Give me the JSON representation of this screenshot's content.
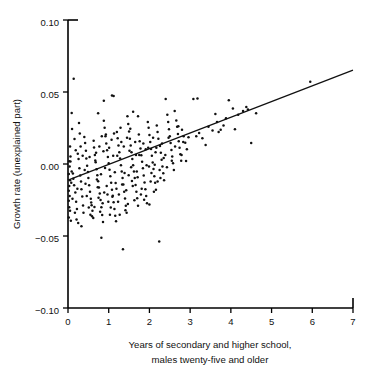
{
  "chart_data": {
    "type": "scatter",
    "title": "",
    "xlabel": "Years of secondary and higher school, males twenty-five and older",
    "xlabel_line1": "Years of secondary and higher school,",
    "xlabel_line2": "males twenty-five and older",
    "ylabel": "Growth rate (unexplained part)",
    "xlim": [
      0,
      7
    ],
    "ylim": [
      -0.1,
      0.1
    ],
    "xticks": [
      0,
      1,
      2,
      3,
      4,
      5,
      6,
      7
    ],
    "xticklabels": [
      "0",
      "1",
      "2",
      "3",
      "4",
      "5",
      "6",
      "7"
    ],
    "yticks": [
      -0.1,
      -0.05,
      0.0,
      0.05,
      0.1
    ],
    "yticklabels": [
      "-0.10",
      "-0.05",
      "0.00",
      "0.05",
      "0.10"
    ],
    "grid": false,
    "legend": "none",
    "marker_color": "#111111",
    "line_color": "#111111",
    "fit_line": {
      "label": "regression line",
      "x": [
        0.0,
        7.0
      ],
      "y": [
        -0.0112,
        0.0652
      ]
    },
    "points": [
      [
        0.14,
        0.0592
      ],
      [
        0.09,
        0.0355
      ],
      [
        0.1,
        0.0243
      ],
      [
        0.16,
        0.0173
      ],
      [
        0.05,
        0.0122
      ],
      [
        0.06,
        0.0052
      ],
      [
        0.03,
        0.0019
      ],
      [
        0.04,
        -0.0018
      ],
      [
        0.02,
        -0.0069
      ],
      [
        0.05,
        -0.0112
      ],
      [
        0.03,
        -0.0152
      ],
      [
        0.02,
        -0.0185
      ],
      [
        0.04,
        -0.0222
      ],
      [
        0.02,
        -0.0255
      ],
      [
        0.03,
        -0.03
      ],
      [
        0.05,
        -0.0325
      ],
      [
        0.02,
        -0.0372
      ],
      [
        0.07,
        -0.0394
      ],
      [
        0.12,
        -0.0066
      ],
      [
        0.13,
        -0.0103
      ],
      [
        0.15,
        -0.0148
      ],
      [
        0.18,
        -0.0198
      ],
      [
        0.2,
        -0.0262
      ],
      [
        0.22,
        -0.0312
      ],
      [
        0.24,
        0.0072
      ],
      [
        0.26,
        0.0034
      ],
      [
        0.28,
        -0.003
      ],
      [
        0.3,
        -0.008
      ],
      [
        0.32,
        -0.0122
      ],
      [
        0.33,
        -0.0175
      ],
      [
        0.35,
        -0.0225
      ],
      [
        0.37,
        -0.0288
      ],
      [
        0.38,
        -0.0338
      ],
      [
        0.4,
        0.0188
      ],
      [
        0.42,
        0.0146
      ],
      [
        0.44,
        0.0092
      ],
      [
        0.45,
        0.0038
      ],
      [
        0.47,
        -0.0013
      ],
      [
        0.49,
        -0.0055
      ],
      [
        0.5,
        -0.0098
      ],
      [
        0.52,
        -0.0148
      ],
      [
        0.54,
        -0.0192
      ],
      [
        0.56,
        -0.0242
      ],
      [
        0.58,
        -0.0286
      ],
      [
        0.6,
        -0.0325
      ],
      [
        0.62,
        -0.0375
      ],
      [
        0.33,
        -0.0432
      ],
      [
        0.27,
        0.0285
      ],
      [
        0.29,
        0.0212
      ],
      [
        0.64,
        0.0115
      ],
      [
        0.66,
        0.0062
      ],
      [
        0.68,
        0.0012
      ],
      [
        0.7,
        -0.0036
      ],
      [
        0.72,
        -0.0078
      ],
      [
        0.74,
        -0.012
      ],
      [
        0.76,
        -0.0163
      ],
      [
        0.78,
        -0.0205
      ],
      [
        0.8,
        -0.025
      ],
      [
        0.82,
        -0.03
      ],
      [
        0.84,
        -0.0355
      ],
      [
        0.86,
        -0.0402
      ],
      [
        0.88,
        0.03
      ],
      [
        0.9,
        0.0252
      ],
      [
        0.92,
        0.0192
      ],
      [
        0.94,
        0.0142
      ],
      [
        0.96,
        0.0095
      ],
      [
        0.98,
        0.0048
      ],
      [
        1.0,
        0.0005
      ],
      [
        1.02,
        -0.004
      ],
      [
        1.04,
        -0.0085
      ],
      [
        1.06,
        -0.013
      ],
      [
        1.08,
        -0.0178
      ],
      [
        1.1,
        -0.022
      ],
      [
        1.12,
        -0.0265
      ],
      [
        1.14,
        -0.0312
      ],
      [
        1.16,
        -0.036
      ],
      [
        1.18,
        -0.0398
      ],
      [
        0.88,
        0.044
      ],
      [
        1.08,
        0.0475
      ],
      [
        1.12,
        0.0472
      ],
      [
        0.74,
        0.0352
      ],
      [
        1.2,
        0.0222
      ],
      [
        1.22,
        0.0178
      ],
      [
        1.24,
        0.0128
      ],
      [
        1.26,
        0.0082
      ],
      [
        1.28,
        0.0038
      ],
      [
        1.3,
        -0.0008
      ],
      [
        1.32,
        -0.0052
      ],
      [
        1.34,
        -0.0098
      ],
      [
        1.36,
        -0.0142
      ],
      [
        1.38,
        -0.0192
      ],
      [
        1.4,
        -0.024
      ],
      [
        1.42,
        -0.029
      ],
      [
        1.44,
        -0.0338
      ],
      [
        1.35,
        -0.0592
      ],
      [
        0.82,
        -0.0512
      ],
      [
        1.46,
        0.0332
      ],
      [
        1.48,
        0.0278
      ],
      [
        1.5,
        0.0225
      ],
      [
        1.52,
        0.0175
      ],
      [
        1.54,
        0.0128
      ],
      [
        1.56,
        0.0082
      ],
      [
        1.58,
        0.0035
      ],
      [
        1.6,
        -0.0008
      ],
      [
        1.62,
        -0.0052
      ],
      [
        1.64,
        -0.0098
      ],
      [
        1.66,
        -0.0145
      ],
      [
        1.68,
        -0.0192
      ],
      [
        1.7,
        -0.0238
      ],
      [
        1.72,
        -0.029
      ],
      [
        1.74,
        0.0205
      ],
      [
        1.76,
        0.0158
      ],
      [
        1.78,
        0.0108
      ],
      [
        1.8,
        0.006
      ],
      [
        1.82,
        0.0015
      ],
      [
        1.84,
        -0.003
      ],
      [
        1.86,
        -0.008
      ],
      [
        1.88,
        -0.0128
      ],
      [
        1.9,
        -0.0175
      ],
      [
        1.92,
        -0.0222
      ],
      [
        1.94,
        -0.0272
      ],
      [
        1.6,
        0.0362
      ],
      [
        1.72,
        0.0332
      ],
      [
        1.96,
        0.0292
      ],
      [
        1.98,
        0.0252
      ],
      [
        2.0,
        0.0202
      ],
      [
        2.02,
        0.0152
      ],
      [
        2.04,
        0.0105
      ],
      [
        2.06,
        0.0058
      ],
      [
        2.08,
        0.001
      ],
      [
        2.1,
        -0.0035
      ],
      [
        2.12,
        -0.0085
      ],
      [
        2.14,
        -0.013
      ],
      [
        2.16,
        -0.0178
      ],
      [
        2.0,
        -0.0282
      ],
      [
        2.24,
        -0.0538
      ],
      [
        2.18,
        0.0268
      ],
      [
        2.2,
        0.0222
      ],
      [
        2.22,
        0.0175
      ],
      [
        2.26,
        0.0125
      ],
      [
        2.28,
        0.0078
      ],
      [
        2.3,
        0.003
      ],
      [
        2.32,
        -0.0018
      ],
      [
        2.34,
        -0.0065
      ],
      [
        2.36,
        -0.0112
      ],
      [
        2.2,
        -0.0122
      ],
      [
        2.4,
        0.0452
      ],
      [
        2.44,
        0.0342
      ],
      [
        2.46,
        0.0292
      ],
      [
        2.48,
        0.0242
      ],
      [
        2.5,
        0.0192
      ],
      [
        2.52,
        0.0145
      ],
      [
        2.54,
        0.0098
      ],
      [
        2.56,
        0.0052
      ],
      [
        2.58,
        0.0005
      ],
      [
        2.6,
        -0.0042
      ],
      [
        2.62,
        0.0368
      ],
      [
        2.66,
        0.0302
      ],
      [
        2.68,
        0.0258
      ],
      [
        2.7,
        0.0208
      ],
      [
        2.72,
        0.0158
      ],
      [
        2.74,
        0.0112
      ],
      [
        2.76,
        0.0068
      ],
      [
        2.78,
        0.0022
      ],
      [
        2.8,
        0.0238
      ],
      [
        2.84,
        0.0192
      ],
      [
        2.88,
        0.0148
      ],
      [
        2.92,
        0.0102
      ],
      [
        2.96,
        0.0185
      ],
      [
        2.9,
        0.002
      ],
      [
        3.08,
        0.0452
      ],
      [
        3.18,
        0.0455
      ],
      [
        3.15,
        0.0192
      ],
      [
        3.22,
        0.0215
      ],
      [
        3.3,
        0.0178
      ],
      [
        3.38,
        0.0132
      ],
      [
        3.45,
        0.0258
      ],
      [
        3.55,
        0.0232
      ],
      [
        3.62,
        0.0348
      ],
      [
        3.66,
        0.0292
      ],
      [
        3.7,
        0.0222
      ],
      [
        3.75,
        0.0238
      ],
      [
        3.82,
        0.0268
      ],
      [
        3.88,
        0.0318
      ],
      [
        3.95,
        0.0442
      ],
      [
        4.05,
        0.0385
      ],
      [
        4.1,
        0.0242
      ],
      [
        4.18,
        0.0342
      ],
      [
        4.3,
        0.0368
      ],
      [
        4.38,
        0.0395
      ],
      [
        4.42,
        0.0378
      ],
      [
        4.5,
        0.0145
      ],
      [
        4.62,
        0.0352
      ],
      [
        5.95,
        0.0572
      ],
      [
        0.06,
        0.0018
      ],
      [
        0.08,
        -0.013
      ],
      [
        0.11,
        -0.0242
      ],
      [
        0.17,
        -0.0338
      ],
      [
        0.21,
        -0.0385
      ],
      [
        0.25,
        -0.041
      ],
      [
        0.31,
        0.0122
      ],
      [
        0.36,
        0.0058
      ],
      [
        0.41,
        -0.0042
      ],
      [
        0.46,
        -0.0222
      ],
      [
        0.51,
        -0.0302
      ],
      [
        0.55,
        -0.0352
      ],
      [
        0.59,
        -0.0362
      ],
      [
        0.63,
        0.0162
      ],
      [
        0.67,
        0.0025
      ],
      [
        0.71,
        -0.0108
      ],
      [
        0.75,
        -0.0235
      ],
      [
        0.79,
        -0.0332
      ],
      [
        0.83,
        0.0192
      ],
      [
        0.87,
        0.0088
      ],
      [
        0.91,
        -0.0028
      ],
      [
        0.95,
        -0.0152
      ],
      [
        0.99,
        -0.0262
      ],
      [
        1.03,
        -0.0352
      ],
      [
        1.07,
        0.0168
      ],
      [
        1.11,
        0.0058
      ],
      [
        1.15,
        -0.0058
      ],
      [
        1.19,
        -0.0172
      ],
      [
        1.23,
        -0.0262
      ],
      [
        1.27,
        -0.0352
      ],
      [
        1.31,
        0.0152
      ],
      [
        1.39,
        -0.0062
      ],
      [
        1.43,
        -0.0182
      ],
      [
        1.47,
        -0.0278
      ],
      [
        1.51,
        0.0092
      ],
      [
        1.55,
        -0.0022
      ],
      [
        1.59,
        -0.0152
      ],
      [
        1.63,
        -0.0252
      ],
      [
        1.67,
        0.0062
      ],
      [
        1.71,
        -0.0092
      ],
      [
        1.79,
        -0.0212
      ],
      [
        1.87,
        -0.0248
      ],
      [
        1.91,
        0.0102
      ],
      [
        1.99,
        -0.0018
      ],
      [
        2.03,
        -0.0122
      ],
      [
        2.11,
        -0.0192
      ],
      [
        2.15,
        0.0082
      ],
      [
        2.27,
        -0.0098
      ],
      [
        2.35,
        0.0042
      ],
      [
        2.43,
        -0.0022
      ],
      [
        0.09,
        -0.0052
      ],
      [
        0.19,
        0.0095
      ],
      [
        0.23,
        -0.0172
      ],
      [
        0.43,
        -0.0138
      ],
      [
        0.53,
        0.0048
      ],
      [
        0.57,
        -0.0268
      ],
      [
        0.65,
        -0.0298
      ],
      [
        0.69,
        0.0078
      ],
      [
        0.73,
        -0.0162
      ],
      [
        0.77,
        0.0122
      ],
      [
        0.81,
        -0.0072
      ],
      [
        0.85,
        -0.0272
      ],
      [
        0.89,
        -0.0198
      ],
      [
        0.93,
        0.0205
      ],
      [
        0.97,
        -0.0212
      ],
      [
        1.01,
        0.0112
      ],
      [
        1.05,
        -0.0302
      ],
      [
        1.09,
        -0.0228
      ],
      [
        1.13,
        0.0212
      ],
      [
        1.17,
        -0.0132
      ],
      [
        1.21,
        0.0058
      ],
      [
        1.25,
        -0.0212
      ],
      [
        1.29,
        0.0252
      ],
      [
        1.33,
        -0.0142
      ],
      [
        1.37,
        0.0122
      ],
      [
        1.41,
        -0.0322
      ],
      [
        1.45,
        0.0182
      ],
      [
        1.49,
        -0.0078
      ],
      [
        1.53,
        0.0245
      ],
      [
        1.57,
        -0.0118
      ],
      [
        1.65,
        0.0152
      ],
      [
        1.69,
        -0.0052
      ],
      [
        1.75,
        0.0062
      ],
      [
        1.81,
        -0.0172
      ],
      [
        1.85,
        0.0142
      ],
      [
        1.93,
        -0.0008
      ],
      [
        1.97,
        0.0112
      ],
      [
        2.05,
        -0.0062
      ],
      [
        2.09,
        0.0182
      ],
      [
        2.13,
        -0.0005
      ],
      [
        2.17,
        0.0112
      ],
      [
        2.25,
        -0.0042
      ],
      [
        2.31,
        0.0142
      ],
      [
        2.39,
        0.0062
      ],
      [
        2.47,
        0.0182
      ],
      [
        2.55,
        0.0022
      ],
      [
        2.63,
        0.0122
      ],
      [
        2.71,
        0.0262
      ],
      [
        2.79,
        0.0062
      ],
      [
        2.83,
        0.0152
      ]
    ]
  },
  "figure": {
    "axis_color": "#111111",
    "background": "#ffffff"
  }
}
